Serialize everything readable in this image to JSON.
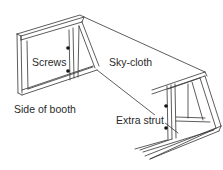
{
  "diagram": {
    "labels": {
      "screws": "Screws",
      "sky_cloth": "Sky-cloth",
      "side_of_booth": "Side of booth",
      "extra_strut": "Extra strut"
    },
    "colors": {
      "line": "#333333",
      "screw": "#111111",
      "background": "#ffffff"
    }
  }
}
